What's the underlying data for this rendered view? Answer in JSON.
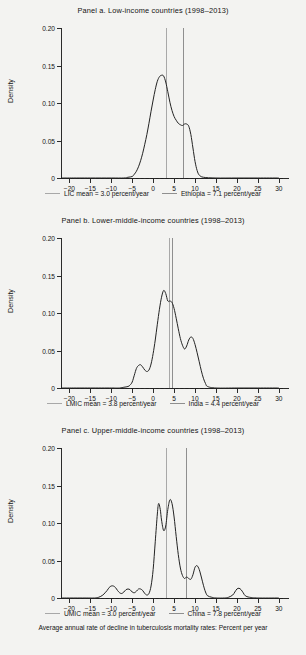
{
  "figure": {
    "caption": "Average annual rate of decline in tuberculosis mortality rates: Percent per year"
  },
  "axis": {
    "ylabel": "Density",
    "yticks": [
      "0",
      "0.05",
      "0.10",
      "0.15",
      "0.20"
    ],
    "ytick_values": [
      0,
      0.05,
      0.1,
      0.15,
      0.2
    ],
    "xticks": [
      "-20",
      "-15",
      "-10",
      "-5",
      "0",
      "5",
      "10",
      "15",
      "20",
      "25",
      "30"
    ],
    "xtick_values": [
      -20,
      -15,
      -10,
      -5,
      0,
      5,
      10,
      15,
      20,
      25,
      30
    ],
    "xlim": [
      -22,
      31
    ],
    "ylim": [
      0,
      0.2
    ]
  },
  "colors": {
    "mean_line": "#a8a8a8",
    "country_line": "#8f8f8f",
    "curve": "#232323",
    "axis": "#2b2b2b",
    "background": "#f3f3f1"
  },
  "panels": [
    {
      "id": "panel-a",
      "title": "Panel a. Low-income countries (1998–2013)",
      "legend": [
        {
          "label": "LIC mean = 3.0 percent/year",
          "color": "#a8a8a8"
        },
        {
          "label": "Ethiopia = 7.1 percent/year",
          "color": "#8f8f8f"
        }
      ]
    },
    {
      "id": "panel-b",
      "title": "Panel b. Lower-middle-income countries (1998–2013)",
      "legend": [
        {
          "label": "LMIC mean = 3.8 percent/year",
          "color": "#a8a8a8"
        },
        {
          "label": "India = 4.4 percent/year",
          "color": "#8f8f8f"
        }
      ]
    },
    {
      "id": "panel-c",
      "title": "Panel c. Upper-middle-income countries (1998–2013)",
      "legend": [
        {
          "label": "UMIC mean = 3.0 percent/year",
          "color": "#a8a8a8"
        },
        {
          "label": "China = 7.8 percent/year",
          "color": "#8f8f8f"
        }
      ]
    }
  ],
  "chart_data": [
    {
      "type": "line",
      "title": "Panel a. Low-income countries (1998–2013)",
      "xlabel": "Average annual rate of decline in tuberculosis mortality rates: Percent per year",
      "ylabel": "Density",
      "xlim": [
        -22,
        31
      ],
      "ylim": [
        0,
        0.2
      ],
      "grid": false,
      "legend_position": "below",
      "series": [
        {
          "name": "Low-income countries kernel density",
          "x": [
            -22,
            -20,
            -15,
            -10,
            -7,
            -6,
            -5,
            -4.5,
            -4,
            -3.5,
            -3,
            -2.5,
            -2,
            -1.5,
            -1,
            -0.5,
            0,
            0.5,
            1,
            1.5,
            2,
            2.5,
            3,
            3.5,
            4,
            4.5,
            5,
            5.5,
            6,
            6.5,
            7,
            7.5,
            8,
            8.5,
            9,
            9.5,
            10,
            10.5,
            11,
            12,
            15,
            20,
            25,
            30
          ],
          "y": [
            0,
            0,
            0,
            0,
            0,
            0.001,
            0.002,
            0.005,
            0.009,
            0.015,
            0.023,
            0.033,
            0.045,
            0.058,
            0.073,
            0.089,
            0.104,
            0.118,
            0.129,
            0.135,
            0.137,
            0.136,
            0.128,
            0.115,
            0.101,
            0.09,
            0.082,
            0.077,
            0.073,
            0.071,
            0.07,
            0.072,
            0.072,
            0.069,
            0.058,
            0.04,
            0.022,
            0.01,
            0.004,
            0.001,
            0,
            0,
            0,
            0
          ]
        }
      ],
      "reference_lines": [
        {
          "name": "LIC mean",
          "value": 3.0,
          "label": "LIC mean = 3.0 percent/year",
          "color": "#a8a8a8"
        },
        {
          "name": "Ethiopia",
          "value": 7.1,
          "label": "Ethiopia = 7.1 percent/year",
          "color": "#8f8f8f"
        }
      ]
    },
    {
      "type": "line",
      "title": "Panel b. Lower-middle-income countries (1998–2013)",
      "xlabel": "Average annual rate of decline in tuberculosis mortality rates: Percent per year",
      "ylabel": "Density",
      "xlim": [
        -22,
        31
      ],
      "ylim": [
        0,
        0.2
      ],
      "grid": false,
      "legend_position": "below",
      "series": [
        {
          "name": "Lower-middle-income countries kernel density",
          "x": [
            -22,
            -20,
            -15,
            -10,
            -8,
            -7,
            -6,
            -5.5,
            -5,
            -4.5,
            -4,
            -3.5,
            -3,
            -2.5,
            -2,
            -1.5,
            -1,
            -0.5,
            0,
            0.5,
            1,
            1.5,
            2,
            2.5,
            3,
            3.5,
            4,
            4.5,
            5,
            5.5,
            6,
            6.5,
            7,
            7.5,
            8,
            8.5,
            9,
            9.5,
            10,
            10.5,
            11,
            11.5,
            12,
            12.5,
            13,
            15,
            20,
            25,
            30
          ],
          "y": [
            0,
            0,
            0,
            0,
            0,
            0.001,
            0.002,
            0.004,
            0.008,
            0.017,
            0.026,
            0.03,
            0.031,
            0.028,
            0.024,
            0.022,
            0.024,
            0.032,
            0.046,
            0.064,
            0.085,
            0.105,
            0.121,
            0.13,
            0.126,
            0.116,
            0.116,
            0.114,
            0.106,
            0.093,
            0.079,
            0.066,
            0.057,
            0.052,
            0.056,
            0.064,
            0.068,
            0.066,
            0.058,
            0.047,
            0.035,
            0.023,
            0.013,
            0.006,
            0.002,
            0,
            0,
            0,
            0
          ]
        }
      ],
      "reference_lines": [
        {
          "name": "LMIC mean",
          "value": 3.8,
          "label": "LMIC mean = 3.8 percent/year",
          "color": "#a8a8a8"
        },
        {
          "name": "India",
          "value": 4.4,
          "label": "India = 4.4 percent/year",
          "color": "#8f8f8f"
        }
      ]
    },
    {
      "type": "line",
      "title": "Panel c. Upper-middle-income countries (1998–2013)",
      "xlabel": "Average annual rate of decline in tuberculosis mortality rates: Percent per year",
      "ylabel": "Density",
      "xlim": [
        -22,
        31
      ],
      "ylim": [
        0,
        0.2
      ],
      "grid": false,
      "legend_position": "below",
      "series": [
        {
          "name": "Upper-middle-income countries kernel density",
          "x": [
            -22,
            -20,
            -16,
            -14,
            -13,
            -12,
            -11,
            -10.5,
            -10,
            -9.5,
            -9,
            -8.5,
            -8,
            -7.5,
            -7,
            -6.5,
            -6,
            -5.5,
            -5,
            -4.5,
            -4,
            -3.5,
            -3,
            -2.5,
            -2,
            -1.5,
            -1,
            -0.5,
            0,
            0.5,
            1,
            1.3,
            1.7,
            2,
            2.5,
            3,
            3.5,
            4,
            4.5,
            5,
            5.5,
            6,
            6.5,
            7,
            7.5,
            8,
            8.5,
            9,
            9.5,
            10,
            10.5,
            11,
            11.5,
            12,
            12.5,
            13,
            14,
            15,
            17,
            18,
            19,
            19.5,
            20,
            20.5,
            21,
            21.5,
            22,
            23,
            25,
            30
          ],
          "y": [
            0,
            0,
            0,
            0,
            0.001,
            0.004,
            0.01,
            0.014,
            0.016,
            0.016,
            0.014,
            0.01,
            0.007,
            0.006,
            0.008,
            0.011,
            0.012,
            0.011,
            0.008,
            0.007,
            0.009,
            0.012,
            0.012,
            0.01,
            0.006,
            0.004,
            0.006,
            0.016,
            0.038,
            0.075,
            0.112,
            0.126,
            0.118,
            0.104,
            0.09,
            0.096,
            0.118,
            0.131,
            0.126,
            0.108,
            0.082,
            0.058,
            0.04,
            0.03,
            0.026,
            0.028,
            0.026,
            0.025,
            0.031,
            0.041,
            0.043,
            0.038,
            0.028,
            0.017,
            0.008,
            0.003,
            0.001,
            0,
            0,
            0.001,
            0.004,
            0.008,
            0.012,
            0.013,
            0.011,
            0.007,
            0.003,
            0.001,
            0,
            0
          ]
        }
      ],
      "reference_lines": [
        {
          "name": "UMIC mean",
          "value": 3.0,
          "label": "UMIC mean = 3.0 percent/year",
          "color": "#a8a8a8"
        },
        {
          "name": "China",
          "value": 7.8,
          "label": "China = 7.8 percent/year",
          "color": "#8f8f8f"
        }
      ]
    }
  ]
}
